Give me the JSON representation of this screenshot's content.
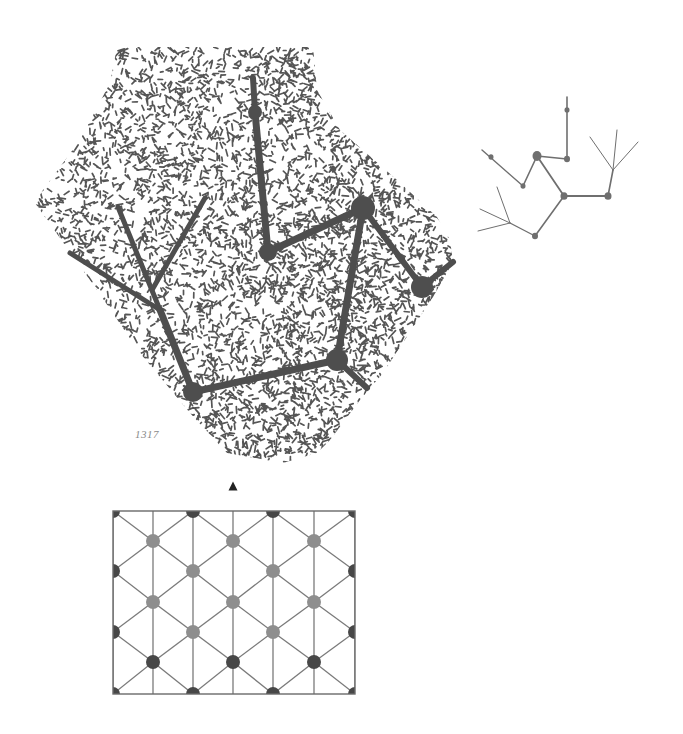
{
  "figure": {
    "label": "1317",
    "label_pos": [
      135,
      428
    ],
    "colors": {
      "stipple": "#555555",
      "tree": "#4e4e4e",
      "small_tree": "#6f6f6f",
      "grid_line": "#7a7a7a",
      "grid_frame": "#6a6a6a",
      "node_light": "#8e8e8e",
      "node_dark": "#474747",
      "marker": "#222222"
    }
  },
  "stippled_region": {
    "outline": [
      [
        117,
        47
      ],
      [
        313,
        47
      ],
      [
        317,
        90
      ],
      [
        340,
        130
      ],
      [
        397,
        180
      ],
      [
        437,
        217
      ],
      [
        450,
        240
      ],
      [
        453,
        262
      ],
      [
        433,
        297
      ],
      [
        383,
        373
      ],
      [
        360,
        400
      ],
      [
        330,
        440
      ],
      [
        317,
        453
      ],
      [
        283,
        463
      ],
      [
        227,
        453
      ],
      [
        190,
        413
      ],
      [
        140,
        353
      ],
      [
        97,
        290
      ],
      [
        35,
        203
      ],
      [
        43,
        190
      ],
      [
        80,
        140
      ],
      [
        110,
        83
      ]
    ],
    "dense_spots": [
      [
        300,
        70,
        22
      ],
      [
        350,
        300,
        40
      ],
      [
        270,
        420,
        45
      ]
    ]
  },
  "large_tree": {
    "nodes": [
      {
        "id": "a",
        "x": 255,
        "y": 112,
        "r": 7
      },
      {
        "id": "b",
        "x": 268,
        "y": 252,
        "r": 9
      },
      {
        "id": "c",
        "x": 363,
        "y": 208,
        "r": 12
      },
      {
        "id": "d",
        "x": 422,
        "y": 287,
        "r": 11
      },
      {
        "id": "e",
        "x": 337,
        "y": 360,
        "r": 11
      },
      {
        "id": "f",
        "x": 193,
        "y": 392,
        "r": 10
      },
      {
        "id": "g",
        "x": 160,
        "y": 310,
        "r": 0
      }
    ],
    "edges": [
      [
        [
          253,
          78
        ],
        [
          255,
          112
        ],
        6
      ],
      [
        [
          255,
          112
        ],
        [
          268,
          252
        ],
        7
      ],
      [
        [
          268,
          252
        ],
        [
          363,
          208
        ],
        7
      ],
      [
        [
          363,
          208
        ],
        [
          422,
          287
        ],
        6
      ],
      [
        [
          422,
          287
        ],
        [
          453,
          262
        ],
        6
      ],
      [
        [
          363,
          208
        ],
        [
          337,
          360
        ],
        7
      ],
      [
        [
          337,
          360
        ],
        [
          367,
          388
        ],
        6
      ],
      [
        [
          337,
          360
        ],
        [
          193,
          392
        ],
        7
      ],
      [
        [
          193,
          392
        ],
        [
          160,
          310
        ],
        7
      ],
      [
        [
          160,
          310
        ],
        [
          70,
          253
        ],
        5
      ],
      [
        [
          160,
          310
        ],
        [
          118,
          207
        ],
        5
      ],
      [
        [
          152,
          290
        ],
        [
          205,
          198
        ],
        5
      ]
    ]
  },
  "small_tree": {
    "nodes": [
      {
        "x": 567,
        "y": 110,
        "r": 2.5
      },
      {
        "x": 567,
        "y": 159,
        "r": 3
      },
      {
        "x": 537,
        "y": 156,
        "r": 4.5
      },
      {
        "x": 523,
        "y": 186,
        "r": 2.5
      },
      {
        "x": 491,
        "y": 157,
        "r": 2.5
      },
      {
        "x": 564,
        "y": 196,
        "r": 3.5
      },
      {
        "x": 608,
        "y": 196,
        "r": 3.5
      },
      {
        "x": 535,
        "y": 236,
        "r": 3
      }
    ],
    "edges": [
      [
        [
          567,
          97
        ],
        [
          567,
          159
        ],
        1.6
      ],
      [
        [
          567,
          159
        ],
        [
          537,
          156
        ],
        1.6
      ],
      [
        [
          537,
          156
        ],
        [
          523,
          186
        ],
        1.6
      ],
      [
        [
          523,
          186
        ],
        [
          482,
          150
        ],
        1.4
      ],
      [
        [
          537,
          156
        ],
        [
          564,
          196
        ],
        1.8
      ],
      [
        [
          564,
          196
        ],
        [
          608,
          196
        ],
        1.8
      ],
      [
        [
          608,
          196
        ],
        [
          613,
          170
        ],
        1.6
      ],
      [
        [
          613,
          170
        ],
        [
          590,
          137
        ],
        1
      ],
      [
        [
          613,
          170
        ],
        [
          617,
          130
        ],
        1
      ],
      [
        [
          613,
          170
        ],
        [
          638,
          142
        ],
        1
      ],
      [
        [
          564,
          196
        ],
        [
          535,
          236
        ],
        1.6
      ],
      [
        [
          535,
          236
        ],
        [
          510,
          223
        ],
        1.4
      ],
      [
        [
          510,
          223
        ],
        [
          497,
          187
        ],
        1
      ],
      [
        [
          510,
          223
        ],
        [
          480,
          209
        ],
        1
      ],
      [
        [
          510,
          223
        ],
        [
          478,
          231
        ],
        1
      ]
    ]
  },
  "marker": {
    "type": "triangle-up",
    "x": 233,
    "y": 486,
    "w": 9,
    "h": 9
  },
  "lattice": {
    "frame": {
      "x": 113,
      "y": 511,
      "w": 242,
      "h": 183
    },
    "columns": [
      113,
      153,
      193,
      233,
      273,
      314,
      355
    ],
    "rows": [
      511,
      541,
      571,
      602,
      632,
      662,
      694
    ],
    "node_radius": 7,
    "nodes": [
      {
        "c": 0,
        "r": 0,
        "t": "dark"
      },
      {
        "c": 2,
        "r": 0,
        "t": "dark"
      },
      {
        "c": 4,
        "r": 0,
        "t": "dark"
      },
      {
        "c": 6,
        "r": 0,
        "t": "dark"
      },
      {
        "c": 1,
        "r": 1,
        "t": "light"
      },
      {
        "c": 3,
        "r": 1,
        "t": "light"
      },
      {
        "c": 5,
        "r": 1,
        "t": "light"
      },
      {
        "c": 0,
        "r": 2,
        "t": "dark"
      },
      {
        "c": 2,
        "r": 2,
        "t": "light"
      },
      {
        "c": 4,
        "r": 2,
        "t": "light"
      },
      {
        "c": 6,
        "r": 2,
        "t": "dark"
      },
      {
        "c": 1,
        "r": 3,
        "t": "light"
      },
      {
        "c": 3,
        "r": 3,
        "t": "light"
      },
      {
        "c": 5,
        "r": 3,
        "t": "light"
      },
      {
        "c": 0,
        "r": 4,
        "t": "dark"
      },
      {
        "c": 2,
        "r": 4,
        "t": "light"
      },
      {
        "c": 4,
        "r": 4,
        "t": "light"
      },
      {
        "c": 6,
        "r": 4,
        "t": "dark"
      },
      {
        "c": 1,
        "r": 5,
        "t": "dark"
      },
      {
        "c": 3,
        "r": 5,
        "t": "dark"
      },
      {
        "c": 5,
        "r": 5,
        "t": "dark"
      },
      {
        "c": 0,
        "r": 6,
        "t": "dark"
      },
      {
        "c": 2,
        "r": 6,
        "t": "dark"
      },
      {
        "c": 4,
        "r": 6,
        "t": "dark"
      },
      {
        "c": 6,
        "r": 6,
        "t": "dark"
      }
    ]
  }
}
